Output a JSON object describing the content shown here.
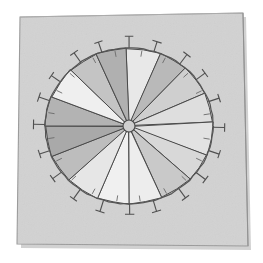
{
  "scene": {
    "title": "Hand-drawn segmented wheel diagram on paper",
    "canvas": {
      "width": 263,
      "height": 263
    },
    "background_color": "#ffffff"
  },
  "paper": {
    "name": "paper-sheet",
    "fill_color": "#d2d2d2",
    "edge_color": "#8c8c8c",
    "shadow_color": "#bcbcbc",
    "corners": [
      {
        "x": 20,
        "y": 17
      },
      {
        "x": 243,
        "y": 13
      },
      {
        "x": 248,
        "y": 246
      },
      {
        "x": 17,
        "y": 244
      }
    ]
  },
  "wheel": {
    "name": "segmented-wheel",
    "center": {
      "x": 129,
      "y": 126
    },
    "radius_x": 84,
    "radius_y": 78,
    "rim_color": "#555555",
    "rim_width": 1.2,
    "spoke_color": "#4a4a4a",
    "spoke_width": 1.0,
    "hub": {
      "name": "center-hub",
      "radius": 6,
      "fill_color": "#cfcfcf",
      "stroke_color": "#4a4a4a"
    }
  },
  "chart_data": {
    "type": "pie",
    "title": "Hand-drawn segmented wheel",
    "xlabel": "",
    "ylabel": "",
    "units": "degrees",
    "total_degrees": 360,
    "categories": [
      "S1",
      "S2",
      "S3",
      "S4",
      "S5",
      "S6",
      "S7",
      "S8",
      "S9",
      "S10",
      "S11",
      "S12",
      "S13",
      "S14",
      "S15",
      "S16"
    ],
    "values": [
      24,
      20,
      23,
      22,
      25,
      21,
      24,
      23,
      22,
      24,
      21,
      23,
      22,
      24,
      21,
      21
    ],
    "start_angle_deg": -92,
    "slice_colors": [
      "#e8e8e8",
      "#b9b9b9",
      "#cfcfcf",
      "#dedede",
      "#e2e2e2",
      "#d8d8d8",
      "#c9c9c9",
      "#ededed",
      "#f0f0f0",
      "#e6e6e6",
      "#bdbdbd",
      "#a9a9a9",
      "#b3b3b3",
      "#efefef",
      "#c4c4c4",
      "#b0b0b0"
    ],
    "legend_position": "none",
    "grid": false,
    "annotations": []
  },
  "ticks": {
    "name": "perimeter-ticks",
    "count": 20,
    "outer_length": 11,
    "cap_length": 9,
    "inner_length": 5,
    "color": "#4f4f4f",
    "width": 1.1,
    "inner_color": "#6a6a6a",
    "labels": []
  }
}
